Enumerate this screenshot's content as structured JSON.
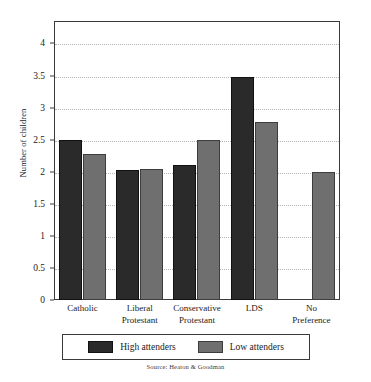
{
  "chart_data": {
    "type": "bar",
    "title": "",
    "xlabel": "",
    "ylabel": "Number of children",
    "ylim": [
      0,
      4.35
    ],
    "yticks": [
      0,
      0.5,
      1,
      1.5,
      2,
      2.5,
      3,
      3.5,
      4
    ],
    "ytick_labels": [
      "0",
      "0.5",
      "1",
      "1.5",
      "2",
      "2.5",
      "3",
      "3.5",
      "4"
    ],
    "grid": true,
    "grid_axis": "y",
    "legend_position": "bottom",
    "categories": [
      "Catholic",
      "Liberal Protestant",
      "Conservative Protestant",
      "LDS",
      "No Preference"
    ],
    "category_lines": [
      [
        "Catholic"
      ],
      [
        "Liberal",
        "Protestant"
      ],
      [
        "Conservative",
        "Protestant"
      ],
      [
        "LDS"
      ],
      [
        "No",
        "Preference"
      ]
    ],
    "series": [
      {
        "name": "High attenders",
        "color": "#2a2a2a",
        "values": [
          2.49,
          2.02,
          2.1,
          3.48,
          null
        ]
      },
      {
        "name": "Low attenders",
        "color": "#6f6f6f",
        "values": [
          2.27,
          2.04,
          2.49,
          2.77,
          2.0
        ]
      }
    ],
    "source": "Source: Heaton & Goodman"
  },
  "legend": {
    "items": [
      {
        "label": "High attenders",
        "swatch": "high"
      },
      {
        "label": "Low attenders",
        "swatch": "low"
      }
    ]
  },
  "colors": {
    "high_attenders": "#2a2a2a",
    "low_attenders": "#6f6f6f",
    "frame": "#3a3a3a",
    "gridline": "#b4b4b4",
    "background": "#ffffff"
  }
}
